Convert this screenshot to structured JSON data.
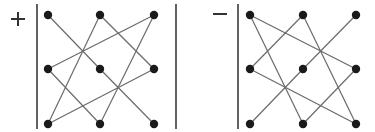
{
  "colors": {
    "line": "#6a6a6a",
    "dot": "#1a1a1a",
    "bar": "#3a3a3a",
    "sign": "#333333",
    "background": "#ffffff"
  },
  "panels": [
    {
      "id": "plus",
      "sign": "+",
      "sign_pos": [
        18,
        19
      ],
      "bars_x": [
        37,
        176
      ],
      "grid_x": [
        48,
        100,
        154
      ],
      "grid_y": [
        15,
        69,
        124
      ],
      "edges": [
        [
          [
            0,
            0
          ],
          [
            1,
            1
          ]
        ],
        [
          [
            1,
            1
          ],
          [
            2,
            2
          ]
        ],
        [
          [
            1,
            0
          ],
          [
            0,
            2
          ]
        ],
        [
          [
            1,
            0
          ],
          [
            2,
            1
          ]
        ],
        [
          [
            2,
            0
          ],
          [
            0,
            1
          ]
        ],
        [
          [
            2,
            0
          ],
          [
            1,
            2
          ]
        ],
        [
          [
            0,
            1
          ],
          [
            1,
            2
          ]
        ],
        [
          [
            2,
            1
          ],
          [
            0,
            2
          ]
        ]
      ]
    },
    {
      "id": "minus",
      "sign": "−",
      "sign_pos": [
        220,
        19
      ],
      "bars_x": [
        238
      ],
      "grid_x": [
        250,
        303,
        356
      ],
      "grid_y": [
        15,
        69,
        124
      ],
      "edges": [
        [
          [
            0,
            0
          ],
          [
            2,
            1
          ]
        ],
        [
          [
            0,
            0
          ],
          [
            1,
            2
          ]
        ],
        [
          [
            1,
            0
          ],
          [
            0,
            1
          ]
        ],
        [
          [
            1,
            0
          ],
          [
            2,
            2
          ]
        ],
        [
          [
            2,
            0
          ],
          [
            1,
            1
          ]
        ],
        [
          [
            1,
            1
          ],
          [
            0,
            2
          ]
        ],
        [
          [
            0,
            1
          ],
          [
            2,
            2
          ]
        ],
        [
          [
            2,
            1
          ],
          [
            1,
            2
          ]
        ]
      ]
    }
  ]
}
